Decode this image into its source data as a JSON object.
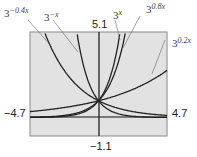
{
  "chart_data": {
    "type": "line",
    "title": "",
    "xlabel": "",
    "ylabel": "",
    "xlim": [
      -4.7,
      4.7
    ],
    "ylim": [
      -1.1,
      5.1
    ],
    "grid": false,
    "tick_labels": {
      "xmin": "−4.7",
      "xmax": "4.7",
      "ymax": "5.1",
      "ymin": "−1.1"
    },
    "series": [
      {
        "name": "3^(-0.4x)",
        "base": "3",
        "exp": "−0.4x",
        "k": -0.4
      },
      {
        "name": "3^(-x)",
        "base": "3",
        "exp": "−x",
        "k": -1
      },
      {
        "name": "3^x",
        "base": "3",
        "exp": "x",
        "k": 1
      },
      {
        "name": "3^(0.8x)",
        "base": "3",
        "exp": "0.8x",
        "k": 0.8
      },
      {
        "name": "3^(0.2x)",
        "base": "3",
        "exp": "0.2x",
        "k": 0.2
      }
    ],
    "annotations": [
      "All curves intersect at (0, 1)"
    ]
  }
}
